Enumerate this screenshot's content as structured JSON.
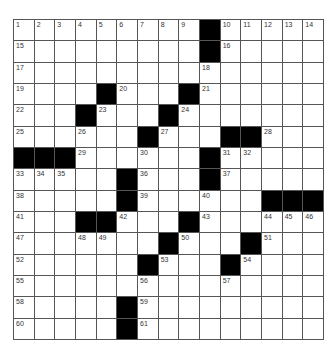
{
  "puzzle": {
    "rows": 15,
    "cols": 15,
    "grid": [
      [
        "1",
        "2",
        "3",
        "4",
        "5",
        "6",
        "7",
        "8",
        "9",
        "#",
        "10",
        "11",
        "12",
        "13",
        "14"
      ],
      [
        "15",
        "",
        "",
        "",
        "",
        "",
        "",
        "",
        "",
        "#",
        "16",
        "",
        "",
        "",
        ""
      ],
      [
        "17",
        "",
        "",
        "",
        "",
        "",
        "",
        "",
        "",
        "18",
        "",
        "",
        "",
        "",
        ""
      ],
      [
        "19",
        "",
        "",
        "",
        "#",
        "20",
        "",
        "",
        "#",
        "21",
        "",
        "",
        "",
        "",
        ""
      ],
      [
        "22",
        "",
        "",
        "#",
        "23",
        "",
        "",
        "#",
        "24",
        "",
        "",
        "",
        "",
        "",
        ""
      ],
      [
        "25",
        "",
        "",
        "26",
        "",
        "",
        "#",
        "27",
        "",
        "",
        "#",
        "#",
        "28",
        "",
        ""
      ],
      [
        "#",
        "#",
        "#",
        "29",
        "",
        "",
        "30",
        "",
        "",
        "#",
        "31",
        "32",
        "",
        "",
        ""
      ],
      [
        "33",
        "34",
        "35",
        "",
        "",
        "#",
        "36",
        "",
        "",
        "#",
        "37",
        "",
        "",
        "",
        ""
      ],
      [
        "38",
        "",
        "",
        "",
        "",
        "#",
        "39",
        "",
        "",
        "40",
        "",
        "",
        "#",
        "#",
        "#"
      ],
      [
        "41",
        "",
        "",
        "#",
        "#",
        "42",
        "",
        "",
        "#",
        "43",
        "",
        "",
        "44",
        "45",
        "46"
      ],
      [
        "47",
        "",
        "",
        "48",
        "49",
        "",
        "",
        "#",
        "50",
        "",
        "",
        "#",
        "51",
        "",
        ""
      ],
      [
        "52",
        "",
        "",
        "",
        "",
        "",
        "#",
        "53",
        "",
        "",
        "#",
        "54",
        "",
        "",
        ""
      ],
      [
        "55",
        "",
        "",
        "",
        "",
        "",
        "56",
        "",
        "",
        "",
        "57",
        "",
        "",
        "",
        ""
      ],
      [
        "58",
        "",
        "",
        "",
        "",
        "#",
        "59",
        "",
        "",
        "",
        "",
        "",
        "",
        "",
        ""
      ],
      [
        "60",
        "",
        "",
        "",
        "",
        "#",
        "61",
        "",
        "",
        "",
        "",
        "",
        "",
        "",
        ""
      ]
    ]
  },
  "colors": {
    "block": "#000000",
    "cell": "#ffffff",
    "grid_line": "#555555",
    "number": "#333333"
  }
}
